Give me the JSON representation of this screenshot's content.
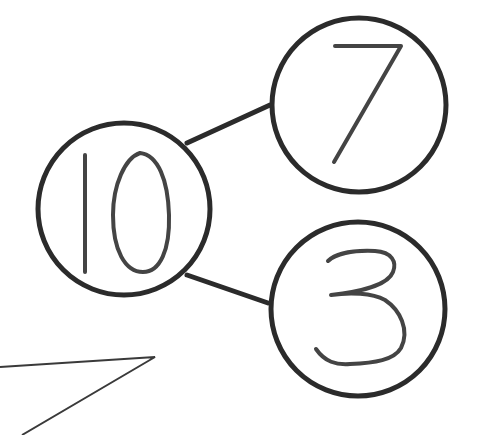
{
  "diagram": {
    "type": "number-bond",
    "whole": {
      "value": "10",
      "label": "whole"
    },
    "parts": [
      {
        "value": "7",
        "label": "part-top"
      },
      {
        "value": "3",
        "label": "part-bottom"
      }
    ],
    "colors": {
      "stroke": "#2b2b2b",
      "digit": "#444444",
      "background": "#ffffff"
    }
  }
}
